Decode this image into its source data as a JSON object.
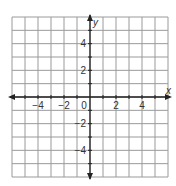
{
  "chart_data": {
    "type": "scatter",
    "title": "",
    "xlabel": "x",
    "ylabel": "y",
    "xlim": [
      -6,
      6
    ],
    "ylim": [
      -6,
      6
    ],
    "grid": true,
    "grid_step": 1,
    "x_ticks": [
      -4,
      -2,
      0,
      2,
      4
    ],
    "x_tick_labels": [
      "−4",
      "−2",
      "0",
      "2",
      "4"
    ],
    "y_ticks": [
      4,
      2,
      -2,
      -4
    ],
    "y_tick_labels": [
      "4",
      "2",
      "−2",
      "−4"
    ],
    "origin_label": "0",
    "series": [],
    "legend": null
  },
  "colors": {
    "background": "#ffffff",
    "grid": "#9a9a9a",
    "axis": "#222222",
    "text": "#333333"
  },
  "geometry": {
    "left": 12,
    "top": 17,
    "right": 168,
    "bottom": 177,
    "cols": 12,
    "rows": 12,
    "origin_col": 6,
    "origin_row": 6
  }
}
